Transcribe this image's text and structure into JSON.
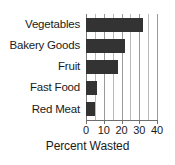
{
  "chart_data": {
    "type": "bar",
    "orientation": "horizontal",
    "title": "",
    "xlabel": "Percent Wasted",
    "ylabel": "",
    "categories": [
      "Vegetables",
      "Bakery Goods",
      "Fruit",
      "Fast Food",
      "Red Meat"
    ],
    "values": [
      32,
      22,
      18,
      6,
      5
    ],
    "xlim": [
      0,
      40
    ],
    "xticks": [
      0,
      10,
      20,
      30,
      40
    ],
    "xtick_labels": [
      "0",
      "10",
      "20",
      "30",
      "40"
    ],
    "gridlines_every": 5,
    "grid": true,
    "legend": null,
    "bar_color": "#333333",
    "gridline_color": "#b9b9b9",
    "axis_color": "#6e6e6e"
  }
}
